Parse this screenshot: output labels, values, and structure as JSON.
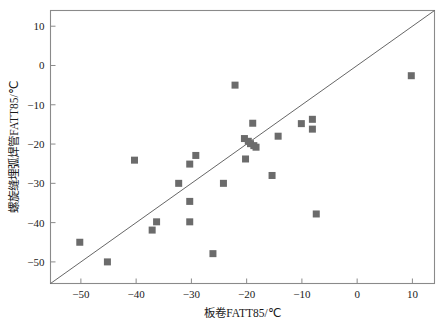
{
  "chart_data": {
    "type": "scatter",
    "title": "",
    "xlabel": "板卷FATT85/℃",
    "ylabel": "螺旋缝埋弧焊管FATT85/℃",
    "xlim": [
      -55.5,
      14.0
    ],
    "ylim": [
      -55.5,
      14.0
    ],
    "xticks": [
      -50,
      -40,
      -30,
      -20,
      -10,
      0,
      10
    ],
    "xtick_labels": [
      "-50",
      "-40",
      "-30",
      "-20",
      "-10",
      "0",
      "10"
    ],
    "yticks": [
      10,
      0,
      -10,
      -20,
      -30,
      -40,
      -50
    ],
    "ytick_labels": [
      "10",
      "0",
      "-10",
      "-20",
      "-30",
      "-40",
      "-50"
    ],
    "grid": false,
    "legend": "none",
    "marker": {
      "shape": "square",
      "color": "#6b6b6b",
      "size": 7
    },
    "reference_line": {
      "name": "y = x",
      "color": "#555555",
      "width": 0.9,
      "x0": -55.5,
      "y0": -55.5,
      "x1": 14.0,
      "y1": 14.0
    },
    "points": [
      {
        "x": -50.2,
        "y": -45.0
      },
      {
        "x": -45.2,
        "y": -50.0
      },
      {
        "x": -40.3,
        "y": -24.1
      },
      {
        "x": -37.1,
        "y": -41.9
      },
      {
        "x": -36.3,
        "y": -39.8
      },
      {
        "x": -32.3,
        "y": -30.0
      },
      {
        "x": -30.3,
        "y": -25.1
      },
      {
        "x": -30.3,
        "y": -34.6
      },
      {
        "x": -30.3,
        "y": -39.8
      },
      {
        "x": -29.2,
        "y": -22.9
      },
      {
        "x": -26.1,
        "y": -47.9
      },
      {
        "x": -24.2,
        "y": -30.0
      },
      {
        "x": -22.1,
        "y": -5.0
      },
      {
        "x": -20.4,
        "y": -18.6
      },
      {
        "x": -20.2,
        "y": -23.8
      },
      {
        "x": -19.7,
        "y": -19.3
      },
      {
        "x": -19.3,
        "y": -19.9
      },
      {
        "x": -18.9,
        "y": -14.7
      },
      {
        "x": -18.7,
        "y": -20.4
      },
      {
        "x": -18.3,
        "y": -20.8
      },
      {
        "x": -15.4,
        "y": -28.0
      },
      {
        "x": -14.3,
        "y": -18.0
      },
      {
        "x": -10.1,
        "y": -14.8
      },
      {
        "x": -8.1,
        "y": -13.7
      },
      {
        "x": -8.1,
        "y": -16.2
      },
      {
        "x": -7.4,
        "y": -37.8
      },
      {
        "x": 9.8,
        "y": -2.6
      }
    ]
  },
  "figure": {
    "frame_color": "#8a8a8a",
    "background": "#ffffff"
  }
}
